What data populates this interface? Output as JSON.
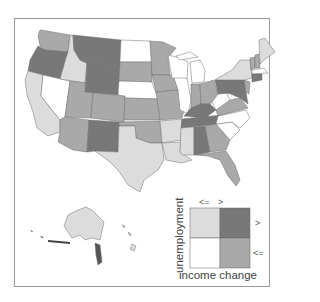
{
  "map": {
    "type": "bivariate choropleth",
    "region": "United States (states, with Alaska and Hawaii insets)",
    "colors": {
      "high_unemp_low_income": "#dcdcdc",
      "high_unemp_high_income": "#787878",
      "low_unemp_low_income": "#ffffff",
      "low_unemp_high_income": "#a9a9a9",
      "border": "#6e6e6e",
      "frame": "#9a9a9a"
    }
  },
  "legend": {
    "x_axis_label": "income change",
    "y_axis_label": "unemployment",
    "col_labels": [
      "<=",
      ">"
    ],
    "row_labels": [
      ">",
      "<="
    ],
    "cells": [
      {
        "row": ">",
        "col": "<=",
        "color": "#dcdcdc"
      },
      {
        "row": ">",
        "col": ">",
        "color": "#787878"
      },
      {
        "row": "<=",
        "col": "<=",
        "color": "#ffffff"
      },
      {
        "row": "<=",
        "col": ">",
        "color": "#a9a9a9"
      }
    ]
  }
}
